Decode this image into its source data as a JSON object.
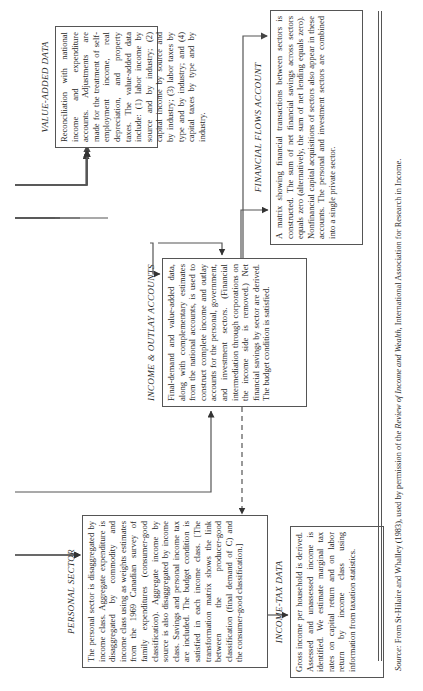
{
  "figure": {
    "boxes": {
      "value_added": {
        "title": "VALUE-ADDED DATA",
        "text": "Reconciliation with national income and expenditure accounts. Adjustments are made for the treatment of self-employment income, real depreciation, and property taxes. The value-added data include: (1) labor income by source and by industry; (2) capital income by source and by industry; (3) labor taxes by type and by industry; and (4) capital taxes by type and by industry."
      },
      "financial_flows": {
        "title": "FINANCIAL FLOWS ACCOUNT",
        "text": "A matrix showing financial transactions between sectors is constructed. The sum of net financial savings across sectors equals zero (alternatively, the sum of net lending equals zero). Nonfinancial capital acquisitions of sectors also appear in these accounts. The personal and investment sectors are combined into a single private sector."
      },
      "income_outlay": {
        "title": "INCOME & OUTLAY ACCOUNTS",
        "text": "Final-demand and value-added data, along with complementary estimates from the national accounts, is used to construct complete income and outlay accounts for the personal, government, and investment sectors. (Financial intermediation through corporations on the income side is removed.) Net financial savings by sector are derived. The budget condition is satisfied."
      },
      "personal_sector": {
        "title": "PERSONAL SECTOR",
        "text": "The personal sector is disaggregated by income class. Aggregate expenditure is disaggregated by commodity and income class using as weights estimates from the 1969 Canadian survey of family expenditures (consumer-good classification). Aggregate income by source is also disaggregated by income class. Savings and personal income tax are included. The budget condition is satisfied in each income class. [The transformation matrix shows the link between the producer-good classification (final demand of C) and the consumer-good classification.]"
      },
      "income_tax": {
        "title": "INCOME-TAX DATA",
        "text": "Gross income per household is derived. Assessed and unassessed income is identified. We estimate marginal tax rates on capital return and on labor return by income class using information from taxation statistics."
      }
    },
    "source_note": {
      "label": "Source:",
      "pre": " From St-Hilaire and Whalley (1983), used by permission of the ",
      "journal": "Review of Income and Wealth,",
      "post": " International Association for Research in Income."
    },
    "colors": {
      "line": "#555555",
      "text": "#2a2a2a",
      "background": "#ffffff"
    }
  }
}
